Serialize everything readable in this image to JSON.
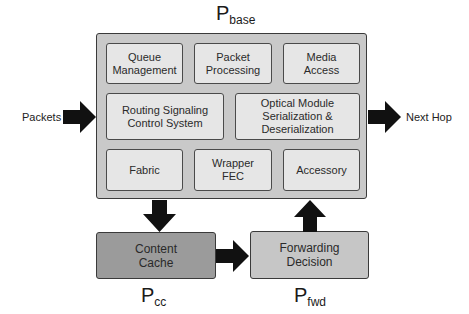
{
  "labels": {
    "base": {
      "main": "P",
      "sub": "base"
    },
    "cc": {
      "main": "P",
      "sub": "cc"
    },
    "fwd": {
      "main": "P",
      "sub": "fwd"
    }
  },
  "external": {
    "input": "Packets",
    "output": "Next Hop"
  },
  "base_modules": {
    "row1": [
      "Queue\nManagement",
      "Packet\nProcessing",
      "Media\nAccess"
    ],
    "row2": [
      "Routing Signaling\nControl System",
      "Optical Module\nSerialization &\nDeserialization"
    ],
    "row3": [
      "Fabric",
      "Wrapper\nFEC",
      "Accessory"
    ]
  },
  "blocks": {
    "content_cache": "Content\nCache",
    "forwarding_decision": "Forwarding\nDecision"
  },
  "colors": {
    "outer_fill": "#c9c9c9",
    "module_fill": "#e6e6e6",
    "cache_fill": "#9b9b9b",
    "forward_fill": "#c6c6c6",
    "arrow": "#111111"
  }
}
